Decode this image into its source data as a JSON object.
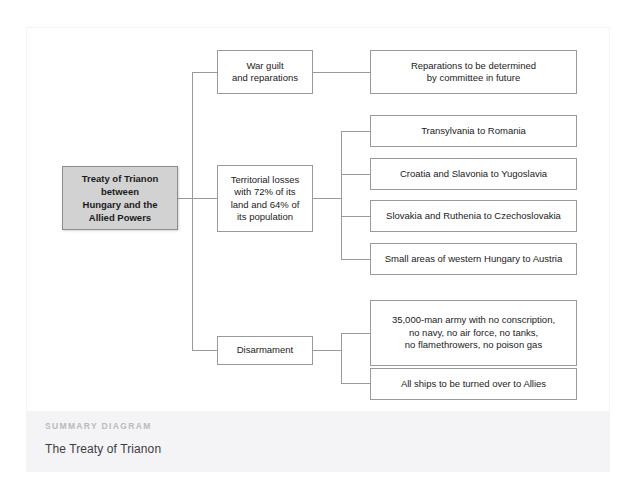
{
  "diagram": {
    "root": {
      "label": "Treaty of Trianon between Hungary and the Allied Powers",
      "lines": [
        "Treaty of Trianon",
        "between",
        "Hungary and the",
        "Allied Powers"
      ],
      "fill": "#d2d2d2",
      "border": "#8d8d8d"
    },
    "branches": [
      {
        "label": "War guilt and reparations",
        "lines": [
          "War guilt",
          "and reparations"
        ],
        "children": [
          {
            "label": "Reparations to be determined by committee in future",
            "lines": [
              "Reparations to be determined",
              "by committee in future"
            ]
          }
        ]
      },
      {
        "label": "Territorial losses with 72% of its land and 64% of its population",
        "lines": [
          "Territorial losses",
          "with 72% of its",
          "land and 64% of",
          "its population"
        ],
        "children": [
          {
            "label": "Transylvania to Romania",
            "lines": [
              "Transylvania to Romania"
            ]
          },
          {
            "label": "Croatia and Slavonia to Yugoslavia",
            "lines": [
              "Croatia and Slavonia to Yugoslavia"
            ]
          },
          {
            "label": "Slovakia and Ruthenia to Czechoslovakia",
            "lines": [
              "Slovakia and Ruthenia to Czechoslovakia"
            ]
          },
          {
            "label": "Small areas of western Hungary to Austria",
            "lines": [
              "Small areas of western Hungary to Austria"
            ]
          }
        ]
      },
      {
        "label": "Disarmament",
        "lines": [
          "Disarmament"
        ],
        "children": [
          {
            "label": "35,000-man army with no conscription, no navy, no air force, no tanks, no flamethrowers, no poison gas",
            "lines": [
              "35,000-man army with no conscription,",
              "no navy, no air force, no tanks,",
              "no flamethrowers, no poison gas"
            ]
          },
          {
            "label": "All ships to be turned over to Allies",
            "lines": [
              "All ships to be turned over to Allies"
            ]
          }
        ]
      }
    ],
    "line_color": "#9a9a9a"
  },
  "footer": {
    "kicker": "SUMMARY DIAGRAM",
    "title": "The Treaty of Trianon",
    "kicker_color": "#b9b9bf",
    "background": "#f4f4f6"
  }
}
